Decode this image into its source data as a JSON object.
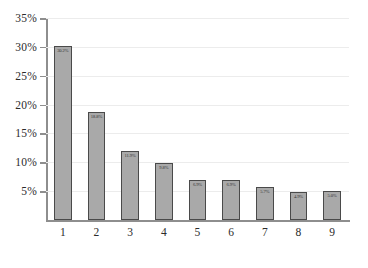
{
  "chart_data": {
    "type": "bar",
    "title": "",
    "xlabel": "",
    "ylabel": "",
    "categories": [
      "1",
      "2",
      "3",
      "4",
      "5",
      "6",
      "7",
      "8",
      "9"
    ],
    "values": [
      30.2,
      18.8,
      11.9,
      9.8,
      6.9,
      6.9,
      5.7,
      4.9,
      5.0
    ],
    "value_labels": [
      "30.2%",
      "18.8%",
      "11.9%",
      "9.8%",
      "6.9%",
      "6.9%",
      "5.7%",
      "4.9%",
      "5.0%"
    ],
    "ylim": [
      0,
      35
    ],
    "y_ticks": [
      5,
      10,
      15,
      20,
      25,
      30,
      35
    ],
    "y_tick_labels": [
      "5%",
      "10%",
      "15%",
      "20%",
      "25%",
      "30%",
      "35%"
    ],
    "grid": true,
    "legend": "none",
    "colors": {
      "bar_fill": "#a9a9a9",
      "bar_border": "#4a4a4a",
      "gridline": "#ececec",
      "axis": "#8e8e8e",
      "text": "#2b2b2b"
    }
  }
}
